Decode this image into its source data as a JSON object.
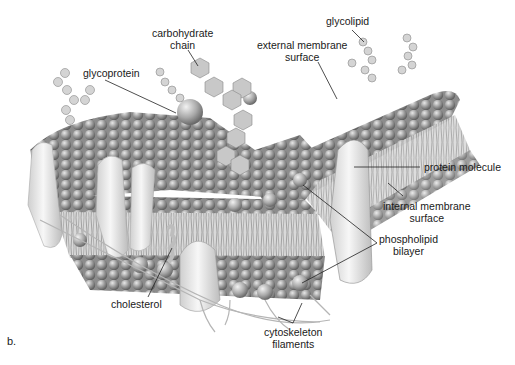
{
  "figure": {
    "panel_letter": "b.",
    "colors": {
      "background": "#ffffff",
      "label_text": "#1a1a1a",
      "leader_line": "#222222",
      "membrane_dark": "#7a7a7a",
      "membrane_light": "#d6d6d6"
    }
  },
  "labels": {
    "carbohydrate_chain": {
      "line1": "carbohydrate",
      "line2": "chain"
    },
    "glycolipid": {
      "line1": "glycolipid"
    },
    "external_membrane_surface": {
      "line1": "external membrane",
      "line2": "surface"
    },
    "glycoprotein": {
      "line1": "glycoprotein"
    },
    "protein_molecule": {
      "line1": "protein molecule"
    },
    "internal_membrane_surface": {
      "line1": "internal membrane",
      "line2": "surface"
    },
    "phospholipid_bilayer": {
      "line1": "phospholipid",
      "line2": "bilayer"
    },
    "cholesterol": {
      "line1": "cholesterol"
    },
    "cytoskeleton_filaments": {
      "line1": "cytoskeleton",
      "line2": "filaments"
    }
  }
}
